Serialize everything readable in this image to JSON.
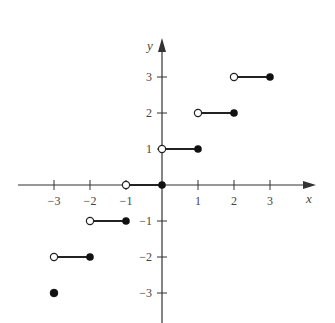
{
  "chart_data": {
    "type": "line",
    "title": "",
    "function": "ceiling",
    "xlabel": "x",
    "ylabel": "y",
    "xlim": [
      -3.9,
      4.2
    ],
    "ylim": [
      -3.8,
      4.2
    ],
    "grid": false,
    "x_ticks": [
      -3,
      -2,
      -1,
      1,
      2,
      3
    ],
    "x_tick_labels": [
      "−3",
      "−2",
      "−1",
      "1",
      "2",
      "3"
    ],
    "y_ticks": [
      3,
      2,
      1,
      -1,
      -2,
      -3
    ],
    "y_tick_labels": [
      "3",
      "2",
      "1",
      "−1",
      "−2",
      "−3"
    ],
    "segments": [
      {
        "x_start": -3,
        "x_end": -2,
        "y": -2,
        "start_open": true,
        "end_closed": true
      },
      {
        "x_start": -2,
        "x_end": -1,
        "y": -1,
        "start_open": true,
        "end_closed": true
      },
      {
        "x_start": -1,
        "x_end": 0,
        "y": 0,
        "start_open": true,
        "end_closed": true
      },
      {
        "x_start": 0,
        "x_end": 1,
        "y": 1,
        "start_open": true,
        "end_closed": true
      },
      {
        "x_start": 1,
        "x_end": 2,
        "y": 2,
        "start_open": true,
        "end_closed": true
      },
      {
        "x_start": 2,
        "x_end": 3,
        "y": 3,
        "start_open": true,
        "end_closed": true
      }
    ],
    "isolated_points": [
      {
        "x": -3,
        "y": -3,
        "closed": true
      }
    ]
  }
}
